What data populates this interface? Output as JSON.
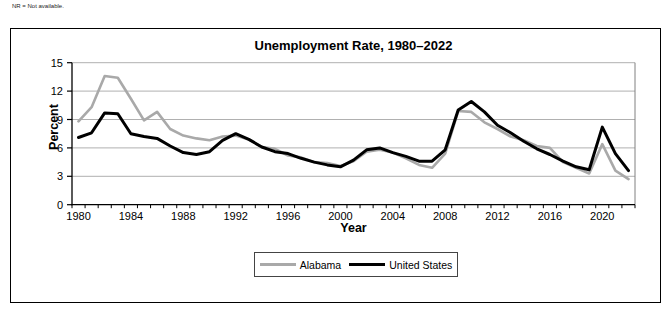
{
  "footnote": "NR = Not available.",
  "chart_data": {
    "type": "line",
    "title": "Unemployment Rate, 1980–2022",
    "xlabel": "Year",
    "ylabel": "Percent",
    "ylim": [
      0,
      15
    ],
    "ytick_step": 3,
    "yticks": [
      0,
      3,
      6,
      9,
      12,
      15
    ],
    "x_tick_labels": [
      1980,
      1984,
      1988,
      1992,
      1996,
      2000,
      2004,
      2008,
      2012,
      2016,
      2020
    ],
    "grid": true,
    "legend_position": "bottom-center-boxed",
    "years": [
      1980,
      1981,
      1982,
      1983,
      1984,
      1985,
      1986,
      1987,
      1988,
      1989,
      1990,
      1991,
      1992,
      1993,
      1994,
      1995,
      1996,
      1997,
      1998,
      1999,
      2000,
      2001,
      2002,
      2003,
      2004,
      2005,
      2006,
      2007,
      2008,
      2009,
      2010,
      2011,
      2012,
      2013,
      2014,
      2015,
      2016,
      2017,
      2018,
      2019,
      2020,
      2021,
      2022
    ],
    "series": [
      {
        "name": "Alabama",
        "color": "#a9a9a9",
        "stroke_width": 2.6,
        "values": [
          8.8,
          10.3,
          13.6,
          13.4,
          11.2,
          8.9,
          9.8,
          8.0,
          7.3,
          7.0,
          6.8,
          7.2,
          7.3,
          6.9,
          6.1,
          5.9,
          5.2,
          5.0,
          4.5,
          4.4,
          4.1,
          4.6,
          5.6,
          5.8,
          5.5,
          4.9,
          4.2,
          3.9,
          5.4,
          9.9,
          9.8,
          8.7,
          8.0,
          7.2,
          6.8,
          6.2,
          6.0,
          4.5,
          3.9,
          3.3,
          6.4,
          3.6,
          2.7
        ]
      },
      {
        "name": "United States",
        "color": "#000000",
        "stroke_width": 3.0,
        "values": [
          7.1,
          7.6,
          9.7,
          9.6,
          7.5,
          7.2,
          7.0,
          6.2,
          5.5,
          5.3,
          5.6,
          6.8,
          7.5,
          6.9,
          6.1,
          5.6,
          5.4,
          4.9,
          4.5,
          4.2,
          4.0,
          4.7,
          5.8,
          6.0,
          5.5,
          5.1,
          4.6,
          4.6,
          5.8,
          10.0,
          10.9,
          9.8,
          8.4,
          7.6,
          6.7,
          5.9,
          5.3,
          4.6,
          4.0,
          3.7,
          8.2,
          5.4,
          3.6
        ]
      }
    ],
    "colors": {
      "gridline": "#b0b0b0",
      "axis": "#000000",
      "plot_right_border": "#808080"
    }
  }
}
